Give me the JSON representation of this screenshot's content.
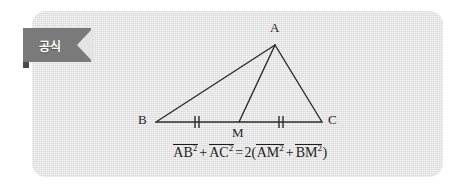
{
  "card": {
    "background_color": "#e4e4e4",
    "border_radius": "14px"
  },
  "ribbon": {
    "label": "공식",
    "background_color": "#7a7a7a",
    "text_color": "#ffffff",
    "fold_color": "#4a4a4a"
  },
  "figure": {
    "type": "geometry-triangle",
    "stroke_color": "#2b2b2b",
    "vertices": [
      {
        "name": "A",
        "label": "A",
        "x": 275,
        "y": 45,
        "label_x": 271,
        "label_y": 26
      },
      {
        "name": "B",
        "label": "B",
        "x": 156,
        "y": 122,
        "label_x": 139,
        "label_y": 114
      },
      {
        "name": "C",
        "label": "C",
        "x": 322,
        "y": 122,
        "label_x": 327,
        "label_y": 114
      },
      {
        "name": "M",
        "label": "M",
        "x": 239,
        "y": 122,
        "label_x": 233,
        "label_y": 127
      }
    ],
    "edges": [
      {
        "name": "AB",
        "from": "A",
        "to": "B"
      },
      {
        "name": "AC",
        "from": "A",
        "to": "C"
      },
      {
        "name": "BC",
        "from": "B",
        "to": "C"
      },
      {
        "name": "AM",
        "from": "A",
        "to": "M"
      }
    ],
    "tick_marks": [
      {
        "name": "BM-tick",
        "segment": "BM",
        "x": 197,
        "y": 122,
        "count": 2
      },
      {
        "name": "MC-tick",
        "segment": "MC",
        "x": 281,
        "y": 122,
        "count": 2
      }
    ]
  },
  "formula": {
    "plain": "AB² + AC² = 2(AM² + BM²)",
    "terms": {
      "ab": "AB",
      "ac": "AC",
      "am": "AM",
      "bm": "BM"
    },
    "exponent": "2",
    "plus": "+",
    "equals": "=",
    "coefficient": "2",
    "open_paren": "(",
    "close_paren": ")"
  }
}
